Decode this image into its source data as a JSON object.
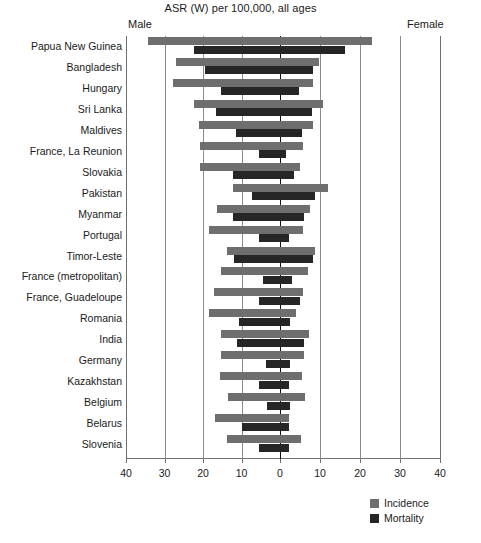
{
  "chart_data": {
    "type": "bar",
    "orientation": "horizontal-diverging",
    "title": "ASR (W) per 100,000, all ages",
    "xlabel": "",
    "ylabel": "",
    "left_side_label": "Male",
    "right_side_label": "Female",
    "xlim": [
      -40,
      40
    ],
    "xticks": [
      40,
      30,
      20,
      10,
      0,
      10,
      20,
      30,
      40
    ],
    "grid": true,
    "legend_position": "bottom-right",
    "series": [
      {
        "name": "Incidence",
        "color": "#6e6e6e"
      },
      {
        "name": "Mortality",
        "color": "#262626"
      }
    ],
    "categories": [
      "Papua New Guinea",
      "Bangladesh",
      "Hungary",
      "Sri Lanka",
      "Maldives",
      "France, La Reunion",
      "Slovakia",
      "Pakistan",
      "Myanmar",
      "Portugal",
      "Timor-Leste",
      "France (metropolitan)",
      "France, Guadeloupe",
      "Romania",
      "India",
      "Germany",
      "Kazakhstan",
      "Belgium",
      "Belarus",
      "Slovenia"
    ],
    "rows": [
      {
        "category": "Papua New Guinea",
        "male_incidence": 34.4,
        "male_mortality": 22.3,
        "female_incidence": 23.0,
        "female_mortality": 16.3
      },
      {
        "category": "Bangladesh",
        "male_incidence": 27.0,
        "male_mortality": 19.5,
        "female_incidence": 9.8,
        "female_mortality": 8.3
      },
      {
        "category": "Hungary",
        "male_incidence": 27.8,
        "male_mortality": 15.3,
        "female_incidence": 8.3,
        "female_mortality": 4.8
      },
      {
        "category": "Sri Lanka",
        "male_incidence": 22.3,
        "male_mortality": 16.6,
        "female_incidence": 10.8,
        "female_mortality": 8.0
      },
      {
        "category": "Maldives",
        "male_incidence": 21.0,
        "male_mortality": 11.4,
        "female_incidence": 8.3,
        "female_mortality": 5.5
      },
      {
        "category": "France, La Reunion",
        "male_incidence": 20.8,
        "male_mortality": 5.5,
        "female_incidence": 5.8,
        "female_mortality": 1.5
      },
      {
        "category": "Slovakia",
        "male_incidence": 20.8,
        "male_mortality": 12.2,
        "female_incidence": 5.0,
        "female_mortality": 3.5
      },
      {
        "category": "Pakistan",
        "male_incidence": 12.2,
        "male_mortality": 7.3,
        "female_incidence": 12.0,
        "female_mortality": 8.8
      },
      {
        "category": "Myanmar",
        "male_incidence": 16.4,
        "male_mortality": 12.2,
        "female_incidence": 7.5,
        "female_mortality": 6.0
      },
      {
        "category": "Portugal",
        "male_incidence": 18.4,
        "male_mortality": 5.5,
        "female_incidence": 5.8,
        "female_mortality": 2.3
      },
      {
        "category": "Timor-Leste",
        "male_incidence": 13.8,
        "male_mortality": 12.0,
        "female_incidence": 8.8,
        "female_mortality": 8.3
      },
      {
        "category": "France (metropolitan)",
        "male_incidence": 15.3,
        "male_mortality": 4.4,
        "female_incidence": 7.0,
        "female_mortality": 3.0
      },
      {
        "category": "France, Guadeloupe",
        "male_incidence": 17.1,
        "male_mortality": 5.5,
        "female_incidence": 5.8,
        "female_mortality": 5.0
      },
      {
        "category": "Romania",
        "male_incidence": 18.4,
        "male_mortality": 10.6,
        "female_incidence": 4.0,
        "female_mortality": 2.5
      },
      {
        "category": "India",
        "male_incidence": 15.3,
        "male_mortality": 11.2,
        "female_incidence": 7.3,
        "female_mortality": 6.0
      },
      {
        "category": "Germany",
        "male_incidence": 15.3,
        "male_mortality": 3.6,
        "female_incidence": 6.0,
        "female_mortality": 2.5
      },
      {
        "category": "Kazakhstan",
        "male_incidence": 15.6,
        "male_mortality": 5.5,
        "female_incidence": 5.5,
        "female_mortality": 2.3
      },
      {
        "category": "Belgium",
        "male_incidence": 13.5,
        "male_mortality": 3.4,
        "female_incidence": 6.3,
        "female_mortality": 2.5
      },
      {
        "category": "Belarus",
        "male_incidence": 16.9,
        "male_mortality": 9.9,
        "female_incidence": 2.3,
        "female_mortality": 2.3
      },
      {
        "category": "Slovenia",
        "male_incidence": 13.8,
        "male_mortality": 5.5,
        "female_incidence": 5.3,
        "female_mortality": 2.3
      }
    ]
  }
}
